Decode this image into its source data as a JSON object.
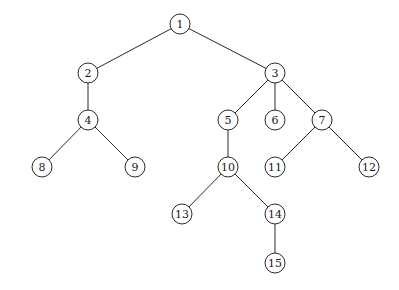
{
  "diagram": {
    "type": "tree",
    "nodes": [
      {
        "id": "1",
        "label": "1"
      },
      {
        "id": "2",
        "label": "2"
      },
      {
        "id": "3",
        "label": "3"
      },
      {
        "id": "4",
        "label": "4"
      },
      {
        "id": "5",
        "label": "5"
      },
      {
        "id": "6",
        "label": "6"
      },
      {
        "id": "7",
        "label": "7"
      },
      {
        "id": "8",
        "label": "8"
      },
      {
        "id": "9",
        "label": "9"
      },
      {
        "id": "10",
        "label": "10"
      },
      {
        "id": "11",
        "label": "11"
      },
      {
        "id": "12",
        "label": "12"
      },
      {
        "id": "13",
        "label": "13"
      },
      {
        "id": "14",
        "label": "14"
      },
      {
        "id": "15",
        "label": "15"
      }
    ],
    "edges": [
      [
        "1",
        "2"
      ],
      [
        "1",
        "3"
      ],
      [
        "2",
        "4"
      ],
      [
        "3",
        "5"
      ],
      [
        "3",
        "6"
      ],
      [
        "3",
        "7"
      ],
      [
        "4",
        "8"
      ],
      [
        "4",
        "9"
      ],
      [
        "5",
        "10"
      ],
      [
        "7",
        "11"
      ],
      [
        "7",
        "12"
      ],
      [
        "10",
        "13"
      ],
      [
        "10",
        "14"
      ],
      [
        "14",
        "15"
      ]
    ]
  }
}
